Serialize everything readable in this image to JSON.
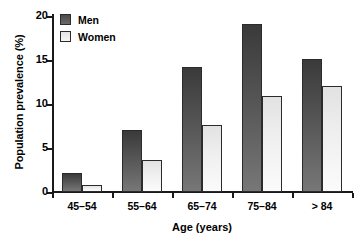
{
  "chart_data": {
    "type": "bar",
    "title": "",
    "xlabel": "Age (years)",
    "ylabel": "Population prevalence (%)",
    "categories": [
      "45–54",
      "55–64",
      "65–74",
      "75–84",
      "> 84"
    ],
    "series": [
      {
        "name": "Men",
        "values": [
          2.2,
          7.1,
          14.2,
          19.1,
          15.1
        ],
        "color": "#555555"
      },
      {
        "name": "Women",
        "values": [
          0.8,
          3.6,
          7.6,
          10.9,
          12.1
        ],
        "color": "#eeeeee"
      }
    ],
    "ylim": [
      0,
      20
    ],
    "yticks": [
      0,
      5,
      10,
      15,
      20
    ],
    "ytick_labels": [
      "0",
      "5",
      "10",
      "15",
      "20"
    ],
    "grid": false,
    "legend_position": "top-left"
  },
  "legend": {
    "items": [
      {
        "label": "Men"
      },
      {
        "label": "Women"
      }
    ]
  },
  "axes": {
    "x_title": "Age (years)",
    "y_title": "Population prevalence (%)"
  }
}
